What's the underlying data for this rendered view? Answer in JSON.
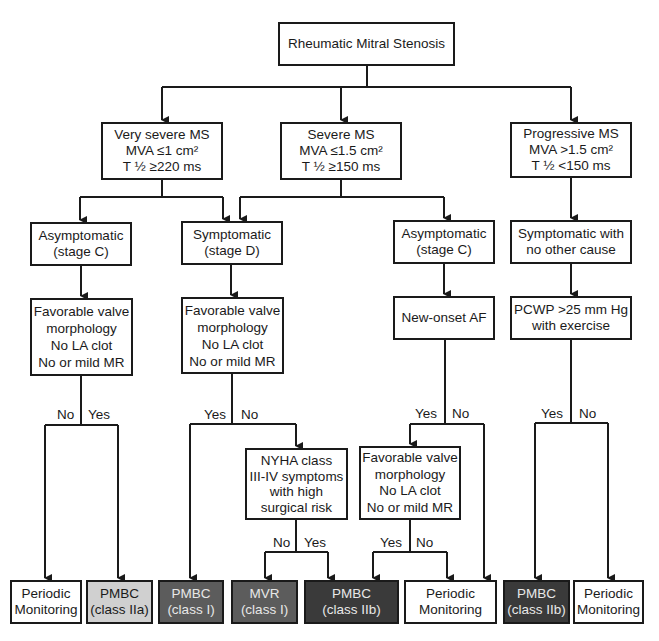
{
  "title": "Rheumatic Mitral Stenosis",
  "level1": {
    "very_severe": {
      "lines": [
        "Very severe MS",
        "MVA ≤1 cm²",
        "T ½ ≥220 ms"
      ]
    },
    "severe": {
      "lines": [
        "Severe MS",
        "MVA ≤1.5 cm²",
        "T ½ ≥150 ms"
      ]
    },
    "progressive": {
      "lines": [
        "Progressive MS",
        "MVA >1.5 cm²",
        "T ½ <150 ms"
      ]
    }
  },
  "level2": {
    "asym_left": {
      "lines": [
        "Asymptomatic",
        "(stage C)"
      ]
    },
    "symptomatic": {
      "lines": [
        "Symptomatic",
        "(stage D)"
      ]
    },
    "asym_right": {
      "lines": [
        "Asymptomatic",
        "(stage C)"
      ]
    },
    "symptomatic_other": {
      "lines": [
        "Symptomatic with",
        "no other cause"
      ]
    }
  },
  "level3": {
    "fav_left": {
      "lines": [
        "Favorable valve",
        "morphology",
        "No LA clot",
        "No or mild MR"
      ]
    },
    "fav_mid": {
      "lines": [
        "Favorable valve",
        "morphology",
        "No LA clot",
        "No or mild MR"
      ]
    },
    "new_onset_af": {
      "lines": [
        "New-onset AF"
      ]
    },
    "pcwp": {
      "lines": [
        "PCWP >25 mm Hg",
        "with exercise"
      ]
    }
  },
  "level4": {
    "nyha": {
      "lines": [
        "NYHA class",
        "III-IV symptoms",
        "with high",
        "surgical risk"
      ]
    },
    "fav_right": {
      "lines": [
        "Favorable valve",
        "morphology",
        "No LA clot",
        "No or mild MR"
      ]
    }
  },
  "branch_labels": {
    "yes": "Yes",
    "no": "No"
  },
  "outcomes": [
    {
      "lines": [
        "Periodic",
        "Monitoring"
      ],
      "fill": "#ffffff"
    },
    {
      "lines": [
        "PMBC",
        "(class IIa)"
      ],
      "fill": "#d0d0d0"
    },
    {
      "lines": [
        "PMBC",
        "(class I)"
      ],
      "fill": "#5c5c5c"
    },
    {
      "lines": [
        "MVR",
        "(class I)"
      ],
      "fill": "#5c5c5c"
    },
    {
      "lines": [
        "PMBC",
        "(class IIb)"
      ],
      "fill": "#3a3a3a"
    },
    {
      "lines": [
        "Periodic",
        "Monitoring"
      ],
      "fill": "#ffffff"
    },
    {
      "lines": [
        "PMBC",
        "(class IIb)"
      ],
      "fill": "#3a3a3a"
    },
    {
      "lines": [
        "Periodic",
        "Monitoring"
      ],
      "fill": "#ffffff"
    }
  ]
}
